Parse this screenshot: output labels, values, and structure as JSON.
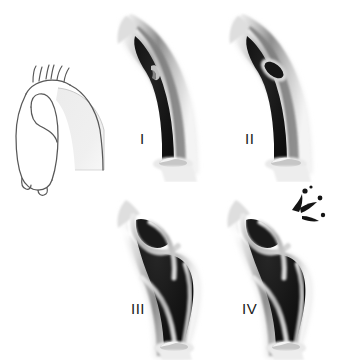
{
  "figure": {
    "background_color": "#ffffff",
    "style": "grayscale medical airbrush illustration",
    "panel_count": 4
  },
  "key_diagram": {
    "name": "aorta-outline-diagram",
    "description": "Line drawing of the thoracic aorta with ascending aorta, three great vessels and descending aorta; a shaded wedge marks the arch segment magnified in panels I-IV",
    "stroke_color": "#4a4a4a",
    "highlight_fill": "#e8e8e8",
    "branch_vessels": [
      "brachiocephalic trunk",
      "left common carotid artery",
      "left subclavian artery"
    ]
  },
  "palette": {
    "lumen_black": "#121212",
    "wall_outer_light": "#e6e6e6",
    "wall_mid_gray": "#9a9a9a",
    "wall_dark_gray": "#6d6d6d",
    "intima_highlight": "#d9d9d9",
    "outline": "#4a4a4a",
    "label_color": "#1a1a1a",
    "background": "#ffffff"
  },
  "panels": [
    {
      "id": "i",
      "label": "I",
      "finding": "intimal tear with small flap in the aortic arch",
      "lesion": "small intimal flap"
    },
    {
      "id": "ii",
      "label": "II",
      "finding": "oval intramural hematoma / penetrating ulcer in arch wall",
      "lesion": "oval wall lesion"
    },
    {
      "id": "iii",
      "label": "III",
      "finding": "dissection with true and false lumen and aneurysmal dilatation",
      "lesion": "dissection flap with false lumen"
    },
    {
      "id": "iv",
      "label": "IV",
      "finding": "aneurysm with contained rupture and extravasation",
      "lesion": "rupture with extravasation spikes"
    }
  ]
}
